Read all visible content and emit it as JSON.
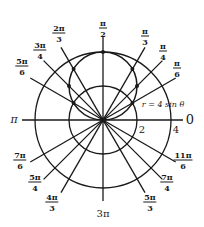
{
  "diagram": {
    "type": "polar-graph",
    "equation_label": "r = 4 sin θ",
    "center_px": [
      103,
      120
    ],
    "unit_px": 17,
    "circles": [
      {
        "name": "grid-circle-r2",
        "r": 2
      },
      {
        "name": "grid-circle-r4",
        "r": 4
      }
    ],
    "curve": {
      "equation": "r = 4 sin θ",
      "center": [
        0,
        2
      ],
      "radius": 2
    },
    "radius_labels": [
      "2",
      "4"
    ],
    "angle_labels": [
      {
        "id": "0",
        "text": "0",
        "x": 190,
        "y": 120
      },
      {
        "id": "pi",
        "text": "π",
        "x": 14,
        "y": 120
      },
      {
        "id": "3pi",
        "text": "3π",
        "x": 103,
        "y": 213
      },
      {
        "id": "pi-2",
        "num": "π",
        "den": "2",
        "x": 103,
        "y": 28
      },
      {
        "id": "pi-3",
        "num": "π",
        "den": "3",
        "x": 145,
        "y": 36
      },
      {
        "id": "pi-4",
        "num": "π",
        "den": "4",
        "x": 163,
        "y": 51
      },
      {
        "id": "pi-6",
        "num": "π",
        "den": "6",
        "x": 177,
        "y": 68
      },
      {
        "id": "2pi-3",
        "num": "2π",
        "den": "3",
        "x": 59,
        "y": 33
      },
      {
        "id": "3pi-4",
        "num": "3π",
        "den": "4",
        "x": 40,
        "y": 50
      },
      {
        "id": "5pi-6",
        "num": "5π",
        "den": "6",
        "x": 22,
        "y": 66
      },
      {
        "id": "7pi-6",
        "num": "7π",
        "den": "6",
        "x": 20,
        "y": 160
      },
      {
        "id": "5pi-4",
        "num": "5π",
        "den": "4",
        "x": 35,
        "y": 182
      },
      {
        "id": "4pi-3",
        "num": "4π",
        "den": "3",
        "x": 52,
        "y": 202
      },
      {
        "id": "5pi-3",
        "num": "5π",
        "den": "3",
        "x": 150,
        "y": 202
      },
      {
        "id": "7pi-4",
        "num": "7π",
        "den": "4",
        "x": 167,
        "y": 182
      },
      {
        "id": "11pi-6",
        "num": "11π",
        "den": "6",
        "x": 183,
        "y": 160
      }
    ],
    "plotted_points_theta": [
      "π/6",
      "π/4",
      "π/3",
      "π/2",
      "2π/3",
      "3π/4",
      "5π/6"
    ],
    "colors": {
      "ink": "#1a1a1a",
      "background": "#ffffff"
    }
  }
}
